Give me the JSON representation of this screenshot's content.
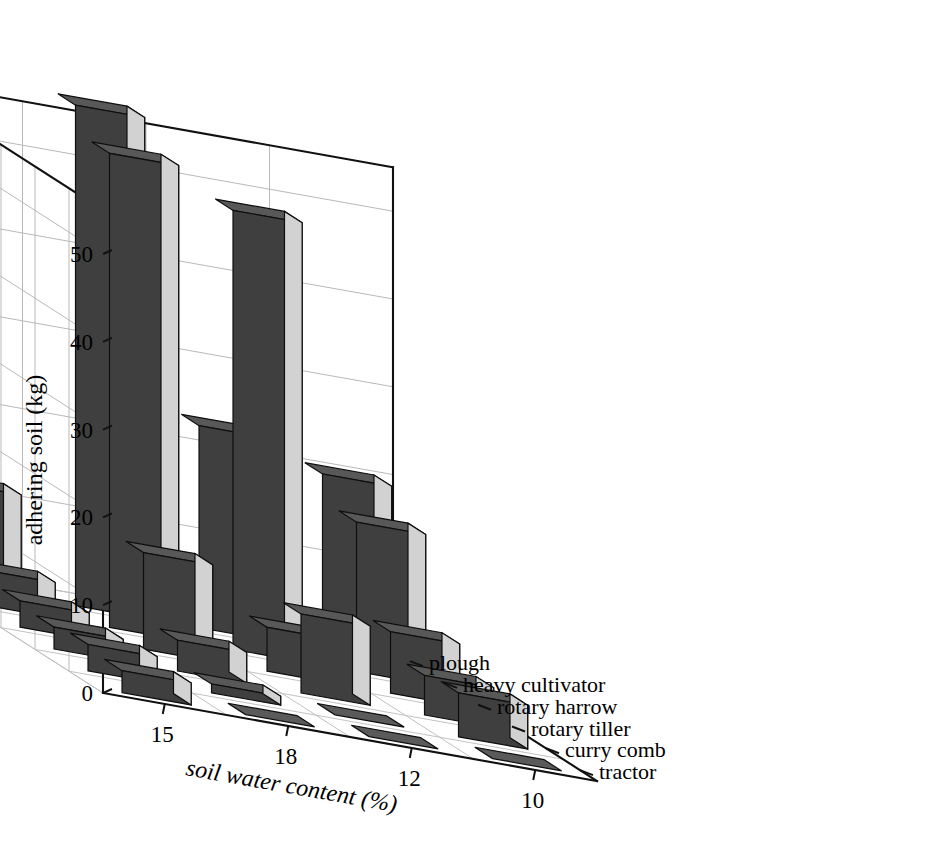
{
  "chart_data": {
    "type": "bar",
    "render": "3d-bar",
    "title": "",
    "xlabel": "soil water content (%)",
    "ylabel": "adhering soil (kg)",
    "zlabel": "",
    "categories": [
      "15",
      "18",
      "12",
      "10"
    ],
    "series_axis_labels": [
      "plough",
      "heavy cultivator",
      "rotary harrow",
      "rotary tiller",
      "curry comb",
      "tractor"
    ],
    "ylim": [
      0,
      55
    ],
    "yticks": [
      0,
      10,
      20,
      30,
      40,
      50
    ],
    "ytick_labels": [
      "0",
      "10",
      "20",
      "30",
      "40",
      "50"
    ],
    "grid": true,
    "legend": "depth-axis-labels",
    "series": [
      {
        "name": "plough",
        "values": [
          11.5,
          57.0,
          23.0,
          20.0
        ]
      },
      {
        "name": "heavy cultivator",
        "values": [
          4.0,
          54.0,
          50.0,
          17.0
        ]
      },
      {
        "name": "rotary harrow",
        "values": [
          3.0,
          11.0,
          5.0,
          7.0
        ]
      },
      {
        "name": "rotary tiller",
        "values": [
          2.5,
          3.5,
          9.0,
          4.5
        ]
      },
      {
        "name": "curry comb",
        "values": [
          3.0,
          1.0,
          0.4,
          5.0
        ]
      },
      {
        "name": "tractor",
        "values": [
          2.5,
          0.4,
          0.4,
          0.4
        ]
      }
    ]
  },
  "colors": {
    "bar_front": "#3f3f3f",
    "bar_side": "#d2d2d2",
    "bar_top": "#585858",
    "axis": "#111111",
    "grid": "#b9b9b9",
    "background": "#ffffff"
  }
}
